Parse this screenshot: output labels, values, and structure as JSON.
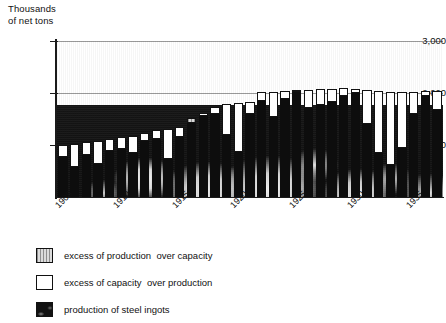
{
  "chart_data": {
    "type": "bar",
    "title": "",
    "subtitle": "",
    "ylabel": "Thousands\nof net tons",
    "xlabel": "",
    "ylim": [
      0,
      3000
    ],
    "yticks": [
      1000,
      2000,
      3000
    ],
    "ytick_labels": [
      "1,000",
      "2,000",
      "3,000"
    ],
    "grid": true,
    "legend_position": "below-left",
    "stacked": true,
    "xtick_labels": [
      "1905",
      "1910",
      "1915",
      "1920",
      "1925",
      "1930",
      "1935"
    ],
    "xticks": [
      1905,
      1910,
      1915,
      1920,
      1925,
      1930,
      1935
    ],
    "legend": [
      {
        "key": "excess_production",
        "label": "excess of production  over capacity",
        "swatch": "gray-hatched"
      },
      {
        "key": "excess_capacity",
        "label": "excess of capacity  over production",
        "swatch": "white"
      },
      {
        "key": "production",
        "label": "production of steel ingots",
        "swatch": "black"
      }
    ],
    "series": [
      {
        "name": "production of steel ingots",
        "key": "production",
        "values": [
          760,
          570,
          810,
          630,
          890,
          930,
          850,
          1080,
          1120,
          740,
          1150,
          1510,
          1550,
          1600,
          1200,
          860,
          1600,
          1840,
          1540,
          1890,
          2010,
          1720,
          1770,
          1830,
          1940,
          2000,
          1400,
          850,
          620,
          950,
          1600,
          1950,
          1670
        ]
      },
      {
        "name": "capacity",
        "key": "capacity",
        "values": [
          1000,
          1020,
          1050,
          1080,
          1120,
          1150,
          1180,
          1230,
          1280,
          1310,
          1350,
          1420,
          1620,
          1730,
          1790,
          1810,
          1830,
          2010,
          2020,
          2030,
          2050,
          2060,
          2070,
          2080,
          2090,
          2080,
          2060,
          2040,
          2020,
          2010,
          2020,
          2030,
          2040
        ]
      }
    ],
    "categories": [
      1905,
      1906,
      1907,
      1908,
      1909,
      1910,
      1911,
      1912,
      1913,
      1914,
      1915,
      1916,
      1917,
      1918,
      1919,
      1920,
      1921,
      1922,
      1923,
      1924,
      1925,
      1926,
      1927,
      1928,
      1929,
      1930,
      1931,
      1932,
      1933,
      1934,
      1935,
      1936,
      1937
    ],
    "bars": [
      {
        "year": 1905,
        "production": 760,
        "capacity": 1000,
        "excess_type": "capacity"
      },
      {
        "year": 1906,
        "production": 570,
        "capacity": 1020,
        "excess_type": "capacity"
      },
      {
        "year": 1907,
        "production": 810,
        "capacity": 1050,
        "excess_type": "capacity"
      },
      {
        "year": 1908,
        "production": 630,
        "capacity": 1080,
        "excess_type": "capacity"
      },
      {
        "year": 1909,
        "production": 890,
        "capacity": 1120,
        "excess_type": "capacity"
      },
      {
        "year": 1910,
        "production": 930,
        "capacity": 1150,
        "excess_type": "capacity"
      },
      {
        "year": 1911,
        "production": 850,
        "capacity": 1180,
        "excess_type": "capacity"
      },
      {
        "year": 1912,
        "production": 1080,
        "capacity": 1230,
        "excess_type": "capacity"
      },
      {
        "year": 1913,
        "production": 1120,
        "capacity": 1280,
        "excess_type": "capacity"
      },
      {
        "year": 1914,
        "production": 740,
        "capacity": 1310,
        "excess_type": "capacity"
      },
      {
        "year": 1915,
        "production": 1150,
        "capacity": 1350,
        "excess_type": "capacity"
      },
      {
        "year": 1916,
        "production": 1510,
        "capacity": 1420,
        "excess_type": "production"
      },
      {
        "year": 1917,
        "production": 1550,
        "capacity": 1620,
        "excess_type": "capacity"
      },
      {
        "year": 1918,
        "production": 1600,
        "capacity": 1730,
        "excess_type": "capacity"
      },
      {
        "year": 1919,
        "production": 1200,
        "capacity": 1790,
        "excess_type": "capacity"
      },
      {
        "year": 1920,
        "production": 860,
        "capacity": 1810,
        "excess_type": "capacity"
      },
      {
        "year": 1921,
        "production": 1600,
        "capacity": 1830,
        "excess_type": "capacity"
      },
      {
        "year": 1922,
        "production": 1840,
        "capacity": 2010,
        "excess_type": "capacity"
      },
      {
        "year": 1923,
        "production": 1540,
        "capacity": 2020,
        "excess_type": "capacity"
      },
      {
        "year": 1924,
        "production": 1890,
        "capacity": 2030,
        "excess_type": "capacity"
      },
      {
        "year": 1925,
        "production": 2010,
        "capacity": 2050,
        "excess_type": "capacity"
      },
      {
        "year": 1926,
        "production": 1720,
        "capacity": 2060,
        "excess_type": "capacity"
      },
      {
        "year": 1927,
        "production": 1770,
        "capacity": 2070,
        "excess_type": "capacity"
      },
      {
        "year": 1928,
        "production": 1830,
        "capacity": 2080,
        "excess_type": "capacity"
      },
      {
        "year": 1929,
        "production": 1940,
        "capacity": 2090,
        "excess_type": "capacity"
      },
      {
        "year": 1930,
        "production": 2000,
        "capacity": 2080,
        "excess_type": "capacity"
      },
      {
        "year": 1931,
        "production": 1400,
        "capacity": 2060,
        "excess_type": "capacity"
      },
      {
        "year": 1932,
        "production": 850,
        "capacity": 2040,
        "excess_type": "capacity"
      },
      {
        "year": 1933,
        "production": 620,
        "capacity": 2020,
        "excess_type": "capacity"
      },
      {
        "year": 1934,
        "production": 950,
        "capacity": 2010,
        "excess_type": "capacity"
      },
      {
        "year": 1935,
        "production": 1600,
        "capacity": 2020,
        "excess_type": "capacity"
      },
      {
        "year": 1936,
        "production": 1950,
        "capacity": 2030,
        "excess_type": "capacity"
      },
      {
        "year": 1937,
        "production": 1670,
        "capacity": 2040,
        "excess_type": "capacity"
      }
    ]
  }
}
